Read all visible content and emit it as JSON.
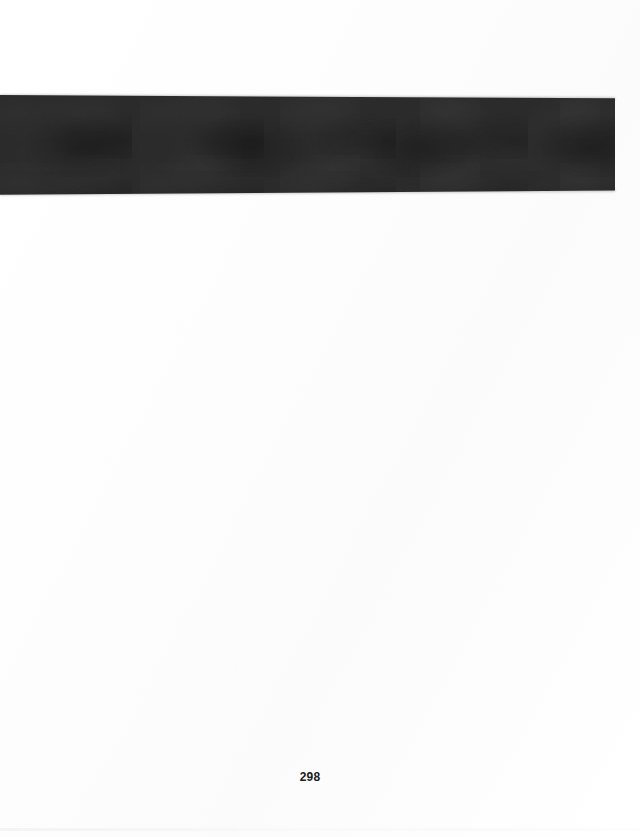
{
  "document": {
    "kind": "scanned-book-page",
    "page_number": "298",
    "background_color": "#fdfdfd",
    "content_summary": "blank page with one large solid dark rectangular block near the top"
  },
  "dark_block": {
    "label": "",
    "fill_color": "#2b2b2b",
    "left_px": 0,
    "top_px": 95,
    "width_px": 614,
    "height_px": 100
  },
  "footer": {
    "page_number": "298",
    "color": "#1c1c1c"
  }
}
